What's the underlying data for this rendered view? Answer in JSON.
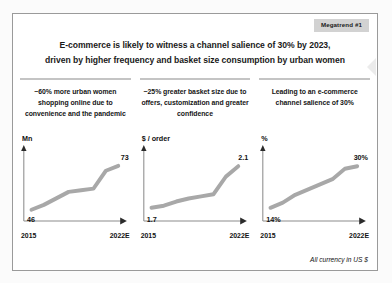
{
  "badge": {
    "label": "Megatrend #1"
  },
  "title": {
    "line1": "E-commerce is likely to witness a channel salience of 30% by 2023,",
    "line2": "driven by higher frequency and basket size consumption by urban women"
  },
  "columns": [
    {
      "text": "~60% more urban women shopping online due to convenience and the pandemic"
    },
    {
      "text": "~25% greater basket size due to offers, customization and greater confidence"
    },
    {
      "text": "Leading to an e-commerce channel salience of 30%"
    }
  ],
  "footnote": "All currency in US $",
  "colors": {
    "line": "#a8a8a8",
    "axis": "#8c8c8c",
    "rule": "#c4c4c4",
    "badge_bg": "#d2d2d2",
    "card_border": "#9a9a9a",
    "page_bg": "#fbfbfb"
  },
  "chart_data": [
    {
      "type": "line",
      "title": "",
      "ylabel": "Mn",
      "xlabel": "",
      "x": [
        "2015",
        "2016",
        "2017",
        "2018",
        "2019",
        "2020",
        "2021",
        "2022E"
      ],
      "values": [
        46,
        49,
        53,
        57,
        58,
        59,
        70,
        73
      ],
      "start_label": "46",
      "end_label": "73",
      "xticks": [
        "2015",
        "2022E"
      ],
      "ylim": [
        44,
        76
      ],
      "grid": false,
      "legend": "none"
    },
    {
      "type": "line",
      "title": "",
      "ylabel": "$ / order",
      "xlabel": "",
      "x": [
        "2015",
        "2016",
        "2017",
        "2018",
        "2019",
        "2020",
        "2021",
        "2022E"
      ],
      "values": [
        1.7,
        1.72,
        1.76,
        1.79,
        1.81,
        1.83,
        2.0,
        2.1
      ],
      "start_label": "1.7",
      "end_label": "2.1",
      "xticks": [
        "2015",
        "2022E"
      ],
      "ylim": [
        1.65,
        2.15
      ],
      "grid": false,
      "legend": "none"
    },
    {
      "type": "line",
      "title": "",
      "ylabel": "%",
      "xlabel": "",
      "x": [
        "2015",
        "2016",
        "2017",
        "2018",
        "2019",
        "2020",
        "2021",
        "2022E"
      ],
      "values": [
        14,
        16,
        19,
        21,
        23,
        25,
        29,
        30
      ],
      "start_label": "14%",
      "end_label": "30%",
      "xticks": [
        "2015",
        "2022E"
      ],
      "ylim": [
        12,
        32
      ],
      "grid": false,
      "legend": "none"
    }
  ]
}
